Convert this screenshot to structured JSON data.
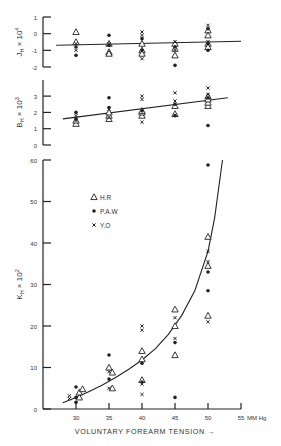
{
  "chart_data": [
    {
      "id": "J",
      "type": "scatter",
      "ylabel": "J_H × 10^4",
      "ylabel_main": "J",
      "ylabel_sub": "H",
      "ylabel_rest": " × 10",
      "ylabel_sup": "4",
      "ylim": [
        -2,
        1
      ],
      "yticks": [
        1,
        0,
        -1,
        -2
      ],
      "xlim": [
        25,
        55
      ],
      "fit": {
        "kind": "linear",
        "x": [
          27,
          55
        ],
        "y": [
          -0.7,
          -0.45
        ]
      },
      "series": [
        {
          "name": "H.R",
          "marker": "triangle",
          "points": [
            [
              30,
              0.1
            ],
            [
              30,
              -0.5
            ],
            [
              35,
              -1.1
            ],
            [
              35,
              -1.2
            ],
            [
              35,
              -0.6
            ],
            [
              40,
              -0.6
            ],
            [
              40,
              -1.0
            ],
            [
              40,
              -1.2
            ],
            [
              45,
              -0.6
            ],
            [
              45,
              -0.9
            ],
            [
              45,
              -1.3
            ],
            [
              50,
              0.2
            ],
            [
              50,
              -0.1
            ],
            [
              50,
              -0.6
            ],
            [
              50,
              -0.8
            ]
          ]
        },
        {
          "name": "P.A.W",
          "marker": "dot",
          "points": [
            [
              30,
              -1.3
            ],
            [
              30,
              -0.8
            ],
            [
              35,
              -0.1
            ],
            [
              35,
              -0.7
            ],
            [
              40,
              -0.3
            ],
            [
              40,
              -1.0
            ],
            [
              45,
              -1.9
            ],
            [
              45,
              -0.8
            ],
            [
              50,
              -1.0
            ],
            [
              50,
              -0.6
            ],
            [
              50,
              0.3
            ]
          ]
        },
        {
          "name": "Y.O",
          "marker": "cross",
          "points": [
            [
              30,
              -0.6
            ],
            [
              30,
              -1.0
            ],
            [
              35,
              -0.6
            ],
            [
              40,
              0.1
            ],
            [
              40,
              -0.1
            ],
            [
              40,
              -1.5
            ],
            [
              45,
              -0.5
            ],
            [
              45,
              -1.0
            ],
            [
              50,
              0.5
            ],
            [
              50,
              -0.5
            ]
          ]
        }
      ]
    },
    {
      "id": "B",
      "type": "scatter",
      "ylabel": "B_H × 10^3",
      "ylabel_main": "B",
      "ylabel_sub": "H",
      "ylabel_rest": " × 10",
      "ylabel_sup": "3",
      "ylim": [
        0,
        3.5
      ],
      "yticks": [
        3,
        2,
        1,
        0
      ],
      "xlim": [
        25,
        55
      ],
      "fit": {
        "kind": "linear",
        "x": [
          28,
          53
        ],
        "y": [
          1.6,
          2.9
        ]
      },
      "series": [
        {
          "name": "H.R",
          "marker": "triangle",
          "points": [
            [
              30,
              1.3
            ],
            [
              30,
              1.5
            ],
            [
              35,
              1.6
            ],
            [
              35,
              1.8
            ],
            [
              35,
              2.0
            ],
            [
              40,
              1.8
            ],
            [
              40,
              2.0
            ],
            [
              40,
              2.1
            ],
            [
              45,
              1.9
            ],
            [
              45,
              2.4
            ],
            [
              50,
              2.4
            ],
            [
              50,
              2.6
            ],
            [
              50,
              2.8
            ],
            [
              50,
              3.0
            ]
          ]
        },
        {
          "name": "P.A.W",
          "marker": "dot",
          "points": [
            [
              30,
              2.0
            ],
            [
              30,
              1.6
            ],
            [
              35,
              2.9
            ],
            [
              35,
              2.3
            ],
            [
              40,
              2.1
            ],
            [
              45,
              1.8
            ],
            [
              45,
              2.5
            ],
            [
              50,
              1.2
            ],
            [
              50,
              2.9
            ]
          ]
        },
        {
          "name": "Y.O",
          "marker": "cross",
          "points": [
            [
              30,
              1.5
            ],
            [
              30,
              1.8
            ],
            [
              35,
              2.2
            ],
            [
              35,
              1.7
            ],
            [
              40,
              2.8
            ],
            [
              40,
              3.0
            ],
            [
              40,
              1.4
            ],
            [
              45,
              3.2
            ],
            [
              45,
              2.7
            ],
            [
              50,
              3.5
            ],
            [
              50,
              3.1
            ]
          ]
        }
      ]
    },
    {
      "id": "K",
      "type": "scatter",
      "title": "",
      "xlabel": "VOLUNTARY FOREARM TENSION →",
      "xunit": "MM Hg",
      "ylabel": "K_H × 10^2",
      "ylabel_main": "K",
      "ylabel_sub": "H",
      "ylabel_rest": " × 10",
      "ylabel_sup": "2",
      "ylim": [
        0,
        60
      ],
      "yticks": [
        60,
        50,
        40,
        30,
        20,
        10,
        0
      ],
      "xlim": [
        25,
        55
      ],
      "xticks": [
        30,
        35,
        40,
        45,
        50,
        55
      ],
      "legend": {
        "position": "upper-left",
        "entries": [
          {
            "label": "H.R",
            "marker": "triangle"
          },
          {
            "label": "P.A.W",
            "marker": "dot"
          },
          {
            "label": "Y.O",
            "marker": "cross"
          }
        ]
      },
      "fit": {
        "kind": "exponential-curve",
        "x": [
          28,
          30,
          32,
          34,
          36,
          38,
          40,
          42,
          44,
          46,
          48,
          50,
          51,
          52.2
        ],
        "y": [
          1.5,
          2.8,
          4.2,
          5.8,
          7.6,
          9.6,
          11.8,
          14.5,
          18.0,
          22.5,
          28.5,
          38.0,
          46.0,
          60.0
        ]
      },
      "series": [
        {
          "name": "H.R",
          "marker": "triangle",
          "points": [
            [
              30.5,
              2.8
            ],
            [
              30.5,
              4.0
            ],
            [
              31,
              4.8
            ],
            [
              35,
              10.0
            ],
            [
              35.5,
              8.8
            ],
            [
              35.5,
              5.0
            ],
            [
              40,
              12.0
            ],
            [
              40,
              14.0
            ],
            [
              40,
              7.0
            ],
            [
              45,
              24.0
            ],
            [
              45,
              20.0
            ],
            [
              45,
              13.0
            ],
            [
              50,
              41.5
            ],
            [
              50,
              34.5
            ],
            [
              50,
              22.5
            ]
          ]
        },
        {
          "name": "P.A.W",
          "marker": "dot",
          "points": [
            [
              30,
              5.3
            ],
            [
              30,
              1.6
            ],
            [
              30,
              2.8
            ],
            [
              35,
              13.0
            ],
            [
              35,
              7.2
            ],
            [
              40,
              11.0
            ],
            [
              40,
              6.5
            ],
            [
              45,
              16.0
            ],
            [
              45,
              2.8
            ],
            [
              50,
              58.8
            ],
            [
              50,
              33.0
            ],
            [
              50,
              28.5
            ]
          ]
        },
        {
          "name": "Y.O",
          "marker": "cross",
          "points": [
            [
              29,
              3.2
            ],
            [
              29,
              2.5
            ],
            [
              35,
              5.0
            ],
            [
              35,
              9.0
            ],
            [
              40,
              20.0
            ],
            [
              40,
              19.0
            ],
            [
              40,
              3.5
            ],
            [
              40,
              6.0
            ],
            [
              45,
              22.0
            ],
            [
              45,
              17.0
            ],
            [
              50,
              38.0
            ],
            [
              50,
              35.5
            ],
            [
              50,
              21.0
            ]
          ]
        }
      ]
    }
  ]
}
